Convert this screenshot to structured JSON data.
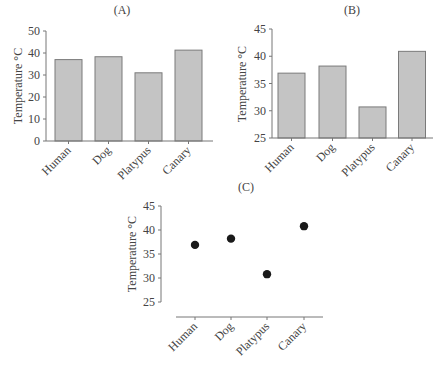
{
  "chart_data": [
    {
      "panel": "(A)",
      "type": "bar",
      "title": "(A)",
      "xlabel": "",
      "ylabel": "Temperature °C",
      "categories": [
        "Human",
        "Dog",
        "Platypus",
        "Canary"
      ],
      "values": [
        37,
        38.3,
        31,
        41.3
      ],
      "ylim": [
        0,
        50
      ],
      "yticks": [
        0,
        10,
        20,
        30,
        40,
        50
      ],
      "grid": false,
      "bar_color": "#c4c4c4"
    },
    {
      "panel": "(B)",
      "type": "bar",
      "title": "(B)",
      "xlabel": "",
      "ylabel": "Temperature °C",
      "categories": [
        "Human",
        "Dog",
        "Platypus",
        "Canary"
      ],
      "values": [
        36.9,
        38.2,
        30.7,
        40.9
      ],
      "ylim": [
        25,
        45
      ],
      "yticks": [
        25,
        30,
        35,
        40,
        45
      ],
      "grid": false,
      "bar_color": "#c4c4c4"
    },
    {
      "panel": "(C)",
      "type": "scatter",
      "title": "(C)",
      "xlabel": "",
      "ylabel": "Temperature °C",
      "categories": [
        "Human",
        "Dog",
        "Platypus",
        "Canary"
      ],
      "values": [
        36.9,
        38.2,
        30.8,
        40.8
      ],
      "ylim": [
        25,
        45
      ],
      "yticks": [
        25,
        30,
        35,
        40,
        45
      ],
      "grid": false,
      "marker_color": "#1a1a1a"
    }
  ]
}
